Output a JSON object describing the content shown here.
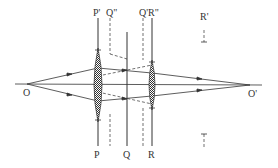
{
  "diagram": {
    "type": "optics-ray-diagram",
    "labels": {
      "O": "O",
      "O_prime": "O'",
      "P": "P",
      "P_prime": "P'",
      "Q": "Q",
      "Q_prime": "Q'",
      "Q_double_prime": "Q\"",
      "R": "R",
      "R_prime": "R'",
      "R_double_prime": "R\""
    },
    "colors": {
      "line": "#333333",
      "background": "#ffffff"
    }
  }
}
